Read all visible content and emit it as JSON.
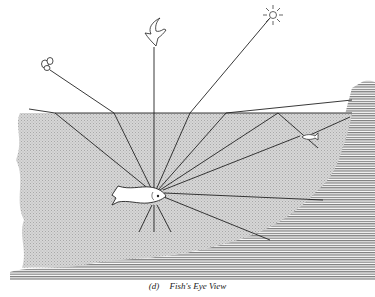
{
  "figure": {
    "caption_label": "(d)",
    "caption_text": "Fish's Eye View",
    "colors": {
      "water": "#cfcfcf",
      "bank": "#9a9a9a",
      "line": "#222222",
      "background": "#ffffff"
    },
    "elements": [
      "insect",
      "bird",
      "sun",
      "fish",
      "small-fish",
      "water-surface",
      "river-bank"
    ]
  }
}
